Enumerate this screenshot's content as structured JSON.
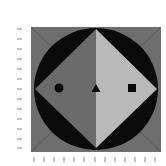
{
  "figure": {
    "colors": {
      "background": "#ffffff",
      "square_fill": "#6e6e6e",
      "square_diagonals": "#5a5a5a",
      "circle_fill": "#0a0a0a",
      "diamond_left": "#6b6b6b",
      "diamond_right": "#b9b9b9",
      "markers": "#0a0a0a",
      "ticks": "#8a8a8a"
    },
    "markers": [
      {
        "shape": "circle",
        "label": "circle-marker"
      },
      {
        "shape": "triangle",
        "label": "triangle-marker"
      },
      {
        "shape": "square",
        "label": "square-marker"
      }
    ],
    "left_ticks": 13,
    "bottom_ticks": 13
  }
}
